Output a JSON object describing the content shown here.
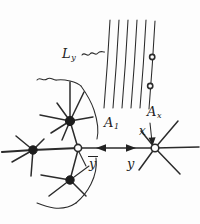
{
  "figure": {
    "kind": "hand-drawn-mathematical-diagram",
    "background_color": "#fdfdfd",
    "ink_color": "#2b2b2b",
    "width": 200,
    "height": 224
  },
  "labels": {
    "line_bundle": {
      "base": "L",
      "sub": "y",
      "text": "Ly"
    },
    "region_left": {
      "base": "A",
      "sub": "1",
      "text": "A1"
    },
    "region_right": {
      "base": "A",
      "sub": "x",
      "text": "Ax"
    },
    "vertex_x": {
      "text": "x"
    },
    "vertex_ybar": {
      "text": "y",
      "overbar": true
    },
    "vertex_y": {
      "text": "y"
    }
  },
  "vertices": [
    {
      "name": "filled-vertex-upper",
      "cx": 70,
      "cy": 121,
      "r": 4.6,
      "style": "filled"
    },
    {
      "name": "filled-vertex-left",
      "cx": 33,
      "cy": 150,
      "r": 4.2,
      "style": "filled"
    },
    {
      "name": "filled-vertex-lower",
      "cx": 70,
      "cy": 180,
      "r": 4.2,
      "style": "filled"
    },
    {
      "name": "open-vertex-ybar",
      "cx": 78,
      "cy": 148,
      "r": 3.6,
      "style": "open"
    },
    {
      "name": "open-vertex-x",
      "cx": 155,
      "cy": 148,
      "r": 3.8,
      "style": "open"
    },
    {
      "name": "open-marker-upper",
      "cx": 152,
      "cy": 57,
      "r": 2.6,
      "style": "open"
    },
    {
      "name": "open-marker-lower",
      "cx": 150,
      "cy": 86,
      "r": 2.6,
      "style": "open"
    }
  ],
  "line_bundle": {
    "count": 6,
    "top_y": 20,
    "bottom_y": 108,
    "top_x": [
      110,
      119,
      128,
      137,
      146,
      155
    ],
    "bottom_x": [
      104,
      113,
      122,
      131,
      140,
      149
    ]
  },
  "arrows": [
    {
      "name": "arrow-left-on-horizontal-edge",
      "direction": "left",
      "x": 100,
      "y": 148
    },
    {
      "name": "arrow-right-on-horizontal-edge",
      "direction": "right",
      "x": 131,
      "y": 148
    },
    {
      "name": "arrow-pointer-to-x-vertex",
      "direction": "down-right",
      "x": 150,
      "y": 140
    }
  ]
}
